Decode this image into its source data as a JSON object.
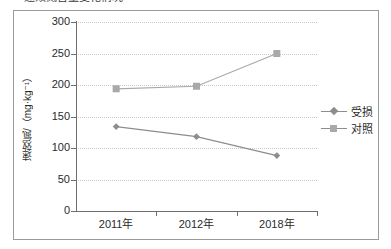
{
  "caption": {
    "text": "速效氮含量变化情况"
  },
  "chart_data": {
    "type": "line",
    "title": "",
    "xlabel": "",
    "ylabel": "速效氮/（mg·kg⁻¹）",
    "categories": [
      "2011年",
      "2012年",
      "2018年"
    ],
    "series": [
      {
        "name": "受损",
        "marker": "diamond",
        "color": "#8d8d8d",
        "values": [
          134,
          118,
          88
        ]
      },
      {
        "name": "对照",
        "marker": "square",
        "color": "#a9a9a9",
        "values": [
          194,
          198,
          250
        ]
      }
    ],
    "ylim": [
      0,
      300
    ],
    "ytick_labels": [
      "0",
      "50",
      "100",
      "150",
      "200",
      "250",
      "300"
    ],
    "ytick_values": [
      0,
      50,
      100,
      150,
      200,
      250,
      300
    ],
    "grid": true,
    "legend_position": "right"
  },
  "legend": {
    "items": [
      {
        "label": "受损"
      },
      {
        "label": "对照"
      }
    ]
  },
  "colors": {
    "series_damaged": "#8d8d8d",
    "series_control": "#a9a9a9",
    "axis": "#6e6e6e",
    "grid": "#c9c9c9",
    "frame": "#9a9a9a",
    "text": "#2b2b2b"
  }
}
